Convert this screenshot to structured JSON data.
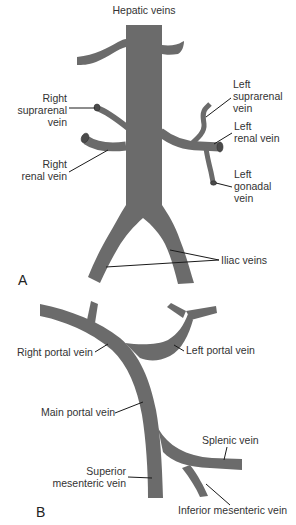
{
  "figure": {
    "panel_a": {
      "letter": "A",
      "labels": {
        "hepatic": "Hepatic veins",
        "right_suprarenal": [
          "Right",
          "suprarenal",
          "vein"
        ],
        "left_suprarenal": [
          "Left",
          "suprarenal",
          "vein"
        ],
        "left_renal": [
          "Left",
          "renal vein"
        ],
        "right_renal": [
          "Right",
          "renal vein"
        ],
        "left_gonadal": [
          "Left",
          "gonadal",
          "vein"
        ],
        "iliac": "Iliac veins"
      }
    },
    "panel_b": {
      "letter": "B",
      "labels": {
        "right_portal": "Right portal vein",
        "left_portal": "Left portal vein",
        "main_portal": "Main portal vein",
        "splenic": "Splenic vein",
        "superior_mesenteric": [
          "Superior",
          "mesenteric vein"
        ],
        "inferior_mesenteric": "Inferior mesenteric vein"
      }
    },
    "colors": {
      "vein": "#6b6b6b",
      "text": "#333333",
      "leader": "#1a1a1a"
    }
  }
}
